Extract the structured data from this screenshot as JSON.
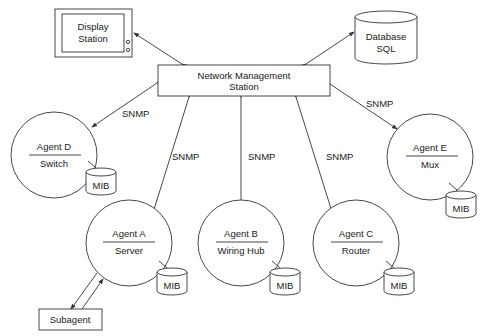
{
  "diagram": {
    "display_station": {
      "line1": "Display",
      "line2": "Station"
    },
    "database": {
      "line1": "Database",
      "line2": "SQL"
    },
    "nms": {
      "line1": "Network Management",
      "line2": "Station"
    },
    "protocol_label": "SNMP",
    "mib_label": "MIB",
    "subagent_label": "Subagent",
    "agents": [
      {
        "id": "d",
        "name": "Agent D",
        "role": "Switch"
      },
      {
        "id": "a",
        "name": "Agent A",
        "role": "Server"
      },
      {
        "id": "b",
        "name": "Agent B",
        "role": "Wiring Hub"
      },
      {
        "id": "c",
        "name": "Agent C",
        "role": "Router"
      },
      {
        "id": "e",
        "name": "Agent E",
        "role": "Mux"
      }
    ],
    "snmp_labels": [
      "SNMP",
      "SNMP",
      "SNMP",
      "SNMP",
      "SNMP"
    ]
  }
}
